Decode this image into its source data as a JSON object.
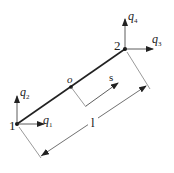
{
  "diagram": {
    "nodes": [
      {
        "id": "1",
        "label": "1",
        "x": 17,
        "y": 124
      },
      {
        "id": "2",
        "label": "2",
        "x": 125,
        "y": 49
      }
    ],
    "midpoint": {
      "label": "o",
      "x": 71,
      "y": 87
    },
    "dofs": {
      "q1": {
        "base": "q",
        "sub": "1"
      },
      "q2": {
        "base": "q",
        "sub": "2"
      },
      "q3": {
        "base": "q",
        "sub": "3"
      },
      "q4": {
        "base": "q",
        "sub": "4"
      }
    },
    "local_coord_label": "s",
    "length_label": "l",
    "colors": {
      "line": "#222222",
      "thin": "#555555"
    }
  }
}
